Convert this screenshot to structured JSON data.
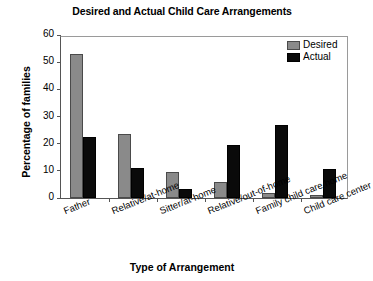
{
  "chart_data": {
    "type": "bar",
    "title": "Desired and Actual Child Care Arrangements",
    "xlabel": "Type of Arrangement",
    "ylabel": "Percentage of families",
    "ylim": [
      0,
      60
    ],
    "yticks": [
      0,
      10,
      20,
      30,
      40,
      50,
      60
    ],
    "grid": false,
    "legend_position": "top-right",
    "categories": [
      "Father",
      "Relative/at-home",
      "Sitter/at-home",
      "Relative/out-of-home",
      "Family child care home",
      "Child care center"
    ],
    "series": [
      {
        "name": "Desired",
        "color": "#8a8a8a",
        "values": [
          53,
          23.5,
          9.5,
          6,
          2,
          1
        ]
      },
      {
        "name": "Actual",
        "color": "#0a0a0a",
        "values": [
          22.5,
          11,
          3.5,
          19.5,
          27,
          10.5
        ]
      }
    ]
  }
}
